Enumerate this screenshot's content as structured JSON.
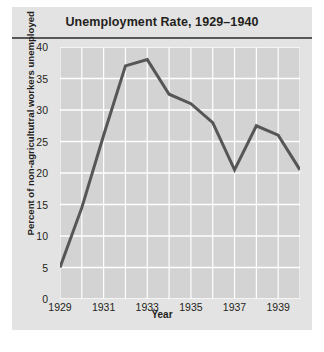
{
  "chart_data": {
    "type": "line",
    "title": "Unemployment Rate, 1929–1940",
    "xlabel": "Year",
    "ylabel": "Percent of non-agricultutral workers unemployed",
    "x": [
      1929,
      1930,
      1931,
      1932,
      1933,
      1934,
      1935,
      1936,
      1937,
      1938,
      1939,
      1940
    ],
    "values": [
      5.0,
      14.5,
      26.0,
      37.0,
      38.0,
      32.5,
      31.0,
      28.0,
      20.5,
      27.5,
      26.0,
      20.5
    ],
    "categories": [
      "1929",
      "1930",
      "1931",
      "1932",
      "1933",
      "1934",
      "1935",
      "1936",
      "1937",
      "1938",
      "1939",
      "1940"
    ],
    "xlim": [
      1929,
      1940
    ],
    "ylim": [
      0,
      40
    ],
    "yticks": [
      0,
      5,
      10,
      15,
      20,
      25,
      30,
      35,
      40
    ],
    "ytick_labels": [
      "0",
      "5",
      "10",
      "15",
      "20",
      "25",
      "30",
      "35",
      "40"
    ],
    "xticks": [
      1929,
      1931,
      1933,
      1935,
      1937,
      1939
    ],
    "xtick_labels": [
      "1929",
      "1931",
      "1933",
      "1935",
      "1937",
      "1939"
    ],
    "grid": true,
    "grid_color": "#ffffff",
    "legend": null,
    "series_color": "#565656",
    "plot_background": "#d3d3d3",
    "figure_background": "#e3e3e3",
    "text_color": "#231f20"
  }
}
